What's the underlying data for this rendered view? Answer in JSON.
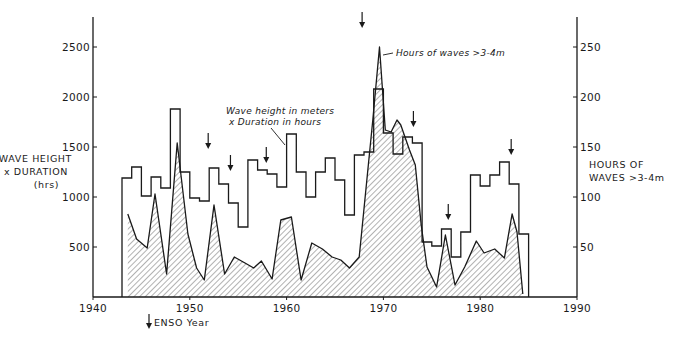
{
  "chart_data": {
    "type": "line",
    "title": "",
    "xlabel": "",
    "ylabel_left": "WAVE HEIGHT x DURATION (hrs)",
    "ylabel_right": "HOURS OF WAVES >3-4m",
    "xlim": [
      1940,
      1990
    ],
    "ylim_left": [
      0,
      2800
    ],
    "ylim_right": [
      0,
      280
    ],
    "x_ticks": [
      1940,
      1950,
      1960,
      1970,
      1980,
      1990
    ],
    "y_ticks_left": [
      500,
      1000,
      1500,
      2000,
      2500
    ],
    "y_ticks_right": [
      50,
      100,
      150,
      200,
      250
    ],
    "grid": false,
    "legend": "annotations",
    "series": [
      {
        "name": "Wave height in meters x Duration in hours",
        "style": "step",
        "axis": "left",
        "x": [
          1943,
          1944,
          1945,
          1946,
          1947,
          1948,
          1949,
          1950,
          1951,
          1952,
          1953,
          1954,
          1955,
          1956,
          1957,
          1958,
          1959,
          1960,
          1961,
          1962,
          1963,
          1964,
          1965,
          1966,
          1967,
          1968,
          1969,
          1970,
          1971,
          1972,
          1973,
          1974,
          1975,
          1976,
          1977,
          1978,
          1979,
          1980,
          1981,
          1982,
          1983,
          1984
        ],
        "values": [
          1190,
          1300,
          1010,
          1200,
          1090,
          1880,
          1250,
          990,
          960,
          1290,
          1130,
          940,
          700,
          1370,
          1270,
          1230,
          1100,
          1630,
          1250,
          1000,
          1250,
          1390,
          1170,
          820,
          1420,
          1450,
          2080,
          1640,
          1430,
          1600,
          1540,
          550,
          510,
          680,
          400,
          650,
          1220,
          1110,
          1220,
          1350,
          1130,
          630
        ]
      },
      {
        "name": "Hours of waves >3-4m",
        "style": "hatched-area",
        "axis": "right",
        "x": [
          1943.6,
          1944.5,
          1945.6,
          1946.4,
          1947.6,
          1948.7,
          1949.8,
          1950.7,
          1951.5,
          1952.5,
          1953.6,
          1954.6,
          1955.7,
          1956.6,
          1957.4,
          1958.5,
          1959.4,
          1960.5,
          1961.5,
          1962.6,
          1963.7,
          1964.7,
          1965.6,
          1966.5,
          1967.5,
          1968.9,
          1969.6,
          1970.2,
          1970.8,
          1971.4,
          1971.8,
          1972.7,
          1973.3,
          1973.9,
          1974.5,
          1975.5,
          1976.4,
          1977.4,
          1978.4,
          1979.6,
          1980.4,
          1981.5,
          1982.5,
          1983.3,
          1983.8,
          1984.4
        ],
        "values": [
          83,
          58,
          49,
          103,
          23,
          154,
          63,
          29,
          17,
          92,
          23,
          40,
          34,
          29,
          36,
          18,
          77,
          80,
          17,
          54,
          48,
          40,
          37,
          29,
          40,
          177,
          250,
          167,
          165,
          177,
          172,
          147,
          132,
          72,
          30,
          10,
          62,
          12,
          30,
          56,
          44,
          48,
          39,
          83,
          65,
          3
        ]
      }
    ],
    "enso_years": [
      1951.9,
      1954.2,
      1957.9,
      1967.8,
      1973.1,
      1976.7,
      1983.2
    ],
    "annotations": [
      {
        "text_lines": [
          "Wave height in meters",
          "x Duration in hours"
        ],
        "points_to": "step-series"
      },
      {
        "text_lines": [
          "Hours of waves >3-4m"
        ],
        "points_to": "hatched-peak-1969"
      }
    ],
    "legend_entries": [
      {
        "symbol": "down-arrow",
        "label": "ENSO Year"
      }
    ]
  },
  "labels": {
    "left_axis": [
      "WAVE HEIGHT",
      "x DURATION",
      "(hrs)"
    ],
    "right_axis": [
      "HOURS OF",
      "WAVES >3-4m"
    ],
    "annot_step": [
      "Wave height in meters",
      "x Duration in hours"
    ],
    "annot_hours": "Hours of waves >3-4m",
    "enso_legend": "ENSO Year"
  },
  "style": {
    "ink": "#1a1a1a",
    "background": "#ffffff",
    "hatch": "#555555"
  }
}
